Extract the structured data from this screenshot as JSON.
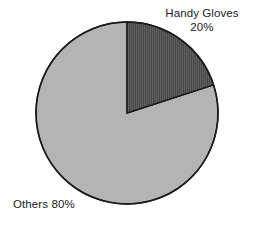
{
  "chart_data": {
    "type": "pie",
    "title": "",
    "subtitle": "",
    "xlabel": "",
    "ylabel": "",
    "grid": false,
    "legend_position": "none",
    "labels_position": "outside",
    "start_angle_deg": 0,
    "direction": "clockwise",
    "categories": [
      "Handy Gloves",
      "Others"
    ],
    "values": [
      20,
      80
    ],
    "unit": "%",
    "slices": [
      {
        "name": "Handy Gloves",
        "value": 20,
        "value_label": "20%",
        "color": "#4a4a4a",
        "pattern": "vertical-hatch",
        "angle_deg": 72,
        "start_deg": 0,
        "end_deg": 72
      },
      {
        "name": "Others",
        "value": 80,
        "value_label": "80%",
        "color": "#b4b4b4",
        "pattern": "solid",
        "angle_deg": 288,
        "start_deg": 72,
        "end_deg": 360
      }
    ],
    "annotations": [
      {
        "id": "handy-gloves",
        "name": "Handy Gloves",
        "value_label": "20%"
      },
      {
        "id": "others",
        "text": "Others 80%"
      }
    ]
  },
  "labels": {
    "handy_gloves_name": "Handy Gloves",
    "handy_gloves_value": "20%",
    "others": "Others 80%"
  },
  "style": {
    "background": "#ffffff",
    "outline_color": "#1a1a1a",
    "text_color": "#1a1a1a",
    "slice_dark": "#4a4a4a",
    "slice_dark_stripe": "#5f5f5f",
    "slice_light": "#b4b4b4"
  }
}
